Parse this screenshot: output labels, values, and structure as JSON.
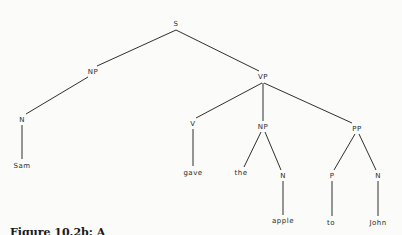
{
  "diagram": {
    "type": "parse-tree",
    "nodes": [
      {
        "id": "S",
        "label": "S",
        "x": 176,
        "y": 26
      },
      {
        "id": "NP1",
        "label": "NP",
        "x": 93,
        "y": 74
      },
      {
        "id": "VP",
        "label": "VP",
        "x": 263,
        "y": 79
      },
      {
        "id": "N1",
        "label": "N",
        "x": 22,
        "y": 122
      },
      {
        "id": "Sam",
        "label": "Sam",
        "x": 22,
        "y": 168
      },
      {
        "id": "V",
        "label": "V",
        "x": 193,
        "y": 126
      },
      {
        "id": "NP2",
        "label": "NP",
        "x": 263,
        "y": 129
      },
      {
        "id": "PP",
        "label": "PP",
        "x": 357,
        "y": 131
      },
      {
        "id": "gave",
        "label": "gave",
        "x": 193,
        "y": 175
      },
      {
        "id": "the",
        "label": "the",
        "x": 241,
        "y": 175
      },
      {
        "id": "N2",
        "label": "N",
        "x": 283,
        "y": 178
      },
      {
        "id": "P",
        "label": "P",
        "x": 332,
        "y": 178
      },
      {
        "id": "N3",
        "label": "N",
        "x": 378,
        "y": 178
      },
      {
        "id": "apple",
        "label": "apple",
        "x": 283,
        "y": 223
      },
      {
        "id": "to",
        "label": "to",
        "x": 331,
        "y": 225
      },
      {
        "id": "John",
        "label": "John",
        "x": 378,
        "y": 225
      }
    ],
    "edges": [
      {
        "from": "S",
        "to": "NP1",
        "x1": 176,
        "y1": 30,
        "x2": 97,
        "y2": 66
      },
      {
        "from": "S",
        "to": "VP",
        "x1": 176,
        "y1": 30,
        "x2": 259,
        "y2": 71
      },
      {
        "from": "NP1",
        "to": "N1",
        "x1": 88,
        "y1": 77,
        "x2": 26,
        "y2": 114
      },
      {
        "from": "N1",
        "to": "Sam",
        "x1": 22,
        "y1": 125,
        "x2": 22,
        "y2": 159
      },
      {
        "from": "VP",
        "to": "V",
        "x1": 262,
        "y1": 83,
        "x2": 196,
        "y2": 118
      },
      {
        "from": "VP",
        "to": "NP2",
        "x1": 263,
        "y1": 83,
        "x2": 263,
        "y2": 121
      },
      {
        "from": "VP",
        "to": "PP",
        "x1": 264,
        "y1": 83,
        "x2": 352,
        "y2": 123
      },
      {
        "from": "V",
        "to": "gave",
        "x1": 193,
        "y1": 129,
        "x2": 193,
        "y2": 166
      },
      {
        "from": "NP2",
        "to": "the",
        "x1": 261,
        "y1": 132,
        "x2": 244,
        "y2": 167
      },
      {
        "from": "NP2",
        "to": "N2",
        "x1": 265,
        "y1": 132,
        "x2": 281,
        "y2": 170
      },
      {
        "from": "PP",
        "to": "P",
        "x1": 355,
        "y1": 134,
        "x2": 334,
        "y2": 170
      },
      {
        "from": "PP",
        "to": "N3",
        "x1": 359,
        "y1": 134,
        "x2": 376,
        "y2": 170
      },
      {
        "from": "N2",
        "to": "apple",
        "x1": 283,
        "y1": 181,
        "x2": 283,
        "y2": 215
      },
      {
        "from": "P",
        "to": "to",
        "x1": 332,
        "y1": 181,
        "x2": 332,
        "y2": 216
      },
      {
        "from": "N3",
        "to": "John",
        "x1": 378,
        "y1": 181,
        "x2": 378,
        "y2": 216
      }
    ],
    "colors": {
      "background": "#fbfbf9",
      "ink": "#2a2a2a"
    }
  },
  "caption": {
    "text": "Figure 10.2b: A"
  }
}
